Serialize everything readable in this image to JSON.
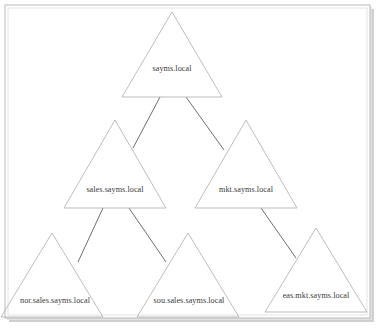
{
  "diagram": {
    "type": "domain-tree",
    "frame": {
      "border_color": "#b9b9b9",
      "shadow_color": "#cfcfcf",
      "background_color": "#ffffff"
    },
    "style": {
      "triangle_stroke": "#b5b5b5",
      "connector_stroke": "#6e6e6e",
      "label_color": "#3a3a3a"
    },
    "nodes": [
      {
        "id": "root",
        "label": "sayms.local",
        "level": 0,
        "apex_x": 172,
        "apex_y": 12,
        "base_y": 97,
        "half_width": 50,
        "label_y": 69
      },
      {
        "id": "sales",
        "label": "sales.sayms.local",
        "level": 1,
        "apex_x": 115,
        "apex_y": 120,
        "base_y": 208,
        "half_width": 51,
        "label_y": 190
      },
      {
        "id": "mkt",
        "label": "mkt.sayms.local",
        "level": 1,
        "apex_x": 246,
        "apex_y": 120,
        "base_y": 208,
        "half_width": 51,
        "label_y": 190
      },
      {
        "id": "nor",
        "label": "nor.sales.sayms.local",
        "level": 2,
        "apex_x": 52,
        "apex_y": 233,
        "base_y": 317,
        "half_width": 51,
        "label_y": 301
      },
      {
        "id": "sou",
        "label": "sou.sales.sayms.local",
        "level": 2,
        "apex_x": 188,
        "apex_y": 233,
        "base_y": 317,
        "half_width": 51,
        "label_y": 301
      },
      {
        "id": "eas",
        "label": "eas.mkt.sayms.local",
        "level": 2,
        "apex_x": 316,
        "apex_y": 228,
        "base_y": 312,
        "half_width": 51,
        "label_y": 296
      }
    ],
    "connectors": [
      {
        "id": "root-sales",
        "from": "root",
        "to": "sales",
        "x1": 160,
        "y1": 97,
        "x2": 133,
        "y2": 148
      },
      {
        "id": "root-mkt",
        "from": "root",
        "to": "mkt",
        "x1": 186,
        "y1": 97,
        "x2": 224,
        "y2": 150
      },
      {
        "id": "sales-nor",
        "from": "sales",
        "to": "nor",
        "x1": 103,
        "y1": 208,
        "x2": 78,
        "y2": 262
      },
      {
        "id": "sales-sou",
        "from": "sales",
        "to": "sou",
        "x1": 129,
        "y1": 208,
        "x2": 166,
        "y2": 262
      },
      {
        "id": "mkt-eas",
        "from": "mkt",
        "to": "eas",
        "x1": 261,
        "y1": 208,
        "x2": 296,
        "y2": 258
      }
    ]
  }
}
